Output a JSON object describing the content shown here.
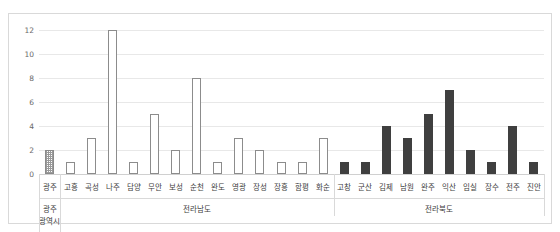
{
  "chart_data": {
    "type": "bar",
    "title": "",
    "xlabel": "",
    "ylabel": "",
    "ylim": [
      0,
      12
    ],
    "yticks": [
      0,
      2,
      4,
      6,
      8,
      10,
      12
    ],
    "grid": true,
    "legend": "none",
    "categories": [
      "광주",
      "고흥",
      "곡성",
      "나주",
      "담양",
      "무안",
      "보성",
      "순천",
      "완도",
      "영광",
      "장성",
      "장흥",
      "함평",
      "화순",
      "고창",
      "군산",
      "김제",
      "남원",
      "완주",
      "익산",
      "임실",
      "장수",
      "전주",
      "진안"
    ],
    "values": [
      2,
      1,
      3,
      12,
      1,
      5,
      2,
      8,
      1,
      3,
      2,
      1,
      1,
      3,
      1,
      1,
      4,
      3,
      5,
      7,
      2,
      1,
      4,
      1
    ],
    "styles": [
      "hatched",
      "outline",
      "outline",
      "outline",
      "outline",
      "outline",
      "outline",
      "outline",
      "outline",
      "outline",
      "outline",
      "outline",
      "outline",
      "outline",
      "filled",
      "filled",
      "filled",
      "filled",
      "filled",
      "filled",
      "filled",
      "filled",
      "filled",
      "filled"
    ],
    "groups": [
      {
        "label_lines": [
          "광주",
          "광역시"
        ],
        "count": 1
      },
      {
        "label_lines": [
          "전라남도"
        ],
        "count": 13
      },
      {
        "label_lines": [
          "전라북도"
        ],
        "count": 10
      }
    ],
    "colors": {
      "filled_bar": "#3f3f3f",
      "outline_bar_stroke": "#8c8c8c",
      "hatched_bar_stroke": "#8a8a8a",
      "gridline": "#e8e8e8",
      "frame": "#d9d9d9",
      "tick_text": "#6a6a6a",
      "label_text": "#3d3d3d"
    }
  }
}
